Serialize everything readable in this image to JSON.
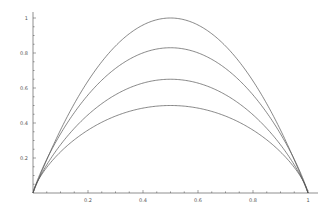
{
  "chart_data": {
    "type": "line",
    "title": "",
    "xlabel": "",
    "ylabel": "",
    "xlim": [
      0,
      1
    ],
    "ylim": [
      0,
      1
    ],
    "grid": false,
    "legend": null,
    "x_ticks": [
      0.2,
      0.4,
      0.6,
      0.8,
      1
    ],
    "x_tick_labels": [
      "0.2",
      "0.4",
      "0.6",
      "0.8",
      "1"
    ],
    "y_ticks": [
      0.2,
      0.4,
      0.6,
      0.8,
      1
    ],
    "y_tick_labels": [
      "0.2",
      "0.4",
      "0.6",
      "0.8",
      "1"
    ],
    "minor_tick_step": 0.05,
    "x": [
      0,
      0.1,
      0.2,
      0.3,
      0.4,
      0.5,
      0.6,
      0.7,
      0.8,
      0.9,
      1
    ],
    "series": [
      {
        "name": "curve-1",
        "peak": 1.0,
        "shape_exp": 1.0,
        "values": [
          0,
          0.34,
          0.64,
          0.84,
          0.96,
          1.0,
          0.96,
          0.84,
          0.64,
          0.34,
          0
        ]
      },
      {
        "name": "curve-2",
        "peak": 0.83,
        "shape_exp": 0.88,
        "values": [
          0,
          0.31,
          0.56,
          0.73,
          0.8,
          0.83,
          0.8,
          0.73,
          0.56,
          0.31,
          0
        ]
      },
      {
        "name": "curve-3",
        "peak": 0.65,
        "shape_exp": 0.84,
        "values": [
          0,
          0.25,
          0.45,
          0.57,
          0.63,
          0.65,
          0.63,
          0.57,
          0.45,
          0.25,
          0
        ]
      },
      {
        "name": "curve-4",
        "peak": 0.5,
        "shape_exp": 0.74,
        "values": [
          0,
          0.19,
          0.36,
          0.44,
          0.49,
          0.5,
          0.49,
          0.44,
          0.36,
          0.19,
          0
        ]
      }
    ],
    "colors": {
      "line": "#555555",
      "axis": "#444444",
      "label": "#555555"
    }
  },
  "plot_box": {
    "x0": 33,
    "x1": 308,
    "y0": 193,
    "y1": 18,
    "x_axis_end": 318
  }
}
